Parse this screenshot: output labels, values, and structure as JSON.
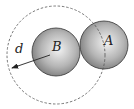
{
  "diagram": {
    "labels": {
      "distance": "d",
      "sphere_b": "B",
      "sphere_a": "A"
    },
    "colors": {
      "sphere_light": "#f4f4f4",
      "sphere_dark": "#6e6e6e",
      "outline": "#333333",
      "dashed": "#555555",
      "background": "#ffffff"
    },
    "elements": [
      {
        "type": "dashed-circle",
        "center": [
          56,
          55
        ],
        "radius": 49,
        "description": "interaction range around B"
      },
      {
        "type": "sphere",
        "name": "B",
        "center": [
          56,
          52
        ],
        "radius": 24
      },
      {
        "type": "sphere",
        "name": "A",
        "center": [
          104,
          45
        ],
        "radius": 24
      },
      {
        "type": "arrow",
        "from": [
          50,
          55
        ],
        "to": [
          11,
          68
        ],
        "label": "d"
      }
    ]
  }
}
